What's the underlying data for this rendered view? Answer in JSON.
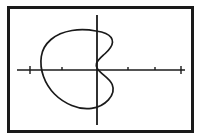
{
  "figure": {
    "description": "A hand-drawn closed blob-like curve centered left of the vertical axis, with a concave S-shaped indentation where it meets the vertical axis, enclosed in a rectangular border.",
    "background_color": "#ffffff",
    "ink_color": "#1a1a1a",
    "frame": {
      "name": "outer-border",
      "x": 7,
      "y": 6,
      "width": 187,
      "height": 127,
      "stroke_width": 3,
      "color": "#1a1a1a"
    },
    "x_axis": {
      "label": "horizontal-axis",
      "y": 70,
      "x_start": 17,
      "x_end": 185,
      "stroke_width": 1.6,
      "color": "#1a1a1a",
      "ticks": [
        {
          "x": 30,
          "height": 4,
          "kind": "full"
        },
        {
          "x": 62,
          "height": 3,
          "kind": "small"
        },
        {
          "x": 128,
          "height": 3,
          "kind": "small"
        },
        {
          "x": 155,
          "height": 3,
          "kind": "small"
        },
        {
          "x": 181,
          "height": 4,
          "kind": "full"
        }
      ]
    },
    "y_axis": {
      "label": "vertical-axis",
      "x": 97,
      "y_start": 15,
      "y_end": 125,
      "stroke_width": 1.8,
      "color": "#1a1a1a",
      "ticks": []
    },
    "origin": {
      "x": 97,
      "y": 70
    },
    "curve": {
      "label": "closed-curve",
      "stroke_width": 1.7,
      "color": "#1a1a1a",
      "closed": true,
      "bounds": {
        "left": 41,
        "top": 30,
        "right": 113,
        "bottom": 109
      },
      "path": "M 96 31 C 88 29.5 80 29.2 72 30.5 C 64 31.8 56.5 34.8 51 39.5 C 45.5 44.2 42.2 50 41.3 56.5 C 40.3 63 41.2 70 43.5 76.5 C 45.8 83 49.6 89 54.5 94 C 59.4 99 65.4 102.8 71.8 105.5 C 78.2 108.2 85 109.3 91.5 108.4 C 98 107.5 104 104.5 108.4 99.8 C 112.8 95.1 114.2 89.3 112.2 84.5 C 110.2 79.7 105.3 76.4 101.5 73.2 C 97.7 70 95.5 67 96.5 63.5 C 97.5 60 101.5 57 105.2 53.5 C 108.9 50 112.3 46 112.5 42.2 C 112.7 38.4 109.7 35.2 105.8 33.4 C 102.5 31.9 99.2 31.4 96 31 Z"
    }
  },
  "chart_data": {
    "type": "line",
    "xlabel": "",
    "ylabel": "",
    "grid": false,
    "legend": "none",
    "axis_ranges": {
      "x": [
        17,
        185
      ],
      "y": [
        15,
        125
      ]
    },
    "series": [
      {
        "name": "closed-curve",
        "closed": true,
        "note": "Blob-shaped closed curve with a concave notch on its right side where it meets the vertical axis, producing multiple intersections with the vertical line.",
        "points": [
          [
            96,
            31
          ],
          [
            84,
            29.6
          ],
          [
            72,
            30.5
          ],
          [
            60,
            33.5
          ],
          [
            51,
            39.5
          ],
          [
            44.5,
            47
          ],
          [
            41.3,
            56.5
          ],
          [
            41,
            65
          ],
          [
            43.5,
            76.5
          ],
          [
            48,
            86
          ],
          [
            54.5,
            94
          ],
          [
            63,
            100.5
          ],
          [
            71.8,
            105.5
          ],
          [
            82,
            108.8
          ],
          [
            91.5,
            108.4
          ],
          [
            101,
            105.5
          ],
          [
            108.4,
            99.8
          ],
          [
            113,
            92
          ],
          [
            112.2,
            84.5
          ],
          [
            107,
            78.5
          ],
          [
            101.5,
            73.2
          ],
          [
            96.5,
            69
          ],
          [
            96.5,
            63.5
          ],
          [
            100,
            58.5
          ],
          [
            105.2,
            53.5
          ],
          [
            110,
            48
          ],
          [
            112.5,
            42.2
          ],
          [
            111,
            36.8
          ],
          [
            105.8,
            33.4
          ],
          [
            96,
            31
          ]
        ]
      }
    ],
    "reference_lines": [
      {
        "name": "x-axis",
        "orientation": "horizontal",
        "value": 70,
        "from": 17,
        "to": 185
      },
      {
        "name": "y-axis",
        "orientation": "vertical",
        "value": 97,
        "from": 15,
        "to": 125
      }
    ],
    "tick_positions_x": [
      30,
      62,
      128,
      155,
      181
    ]
  }
}
